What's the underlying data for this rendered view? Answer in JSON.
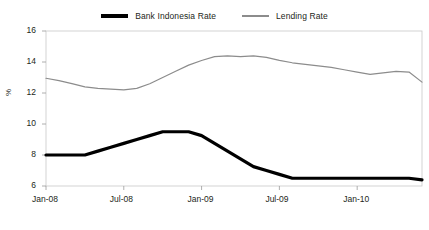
{
  "chart_data": {
    "type": "line",
    "title": "",
    "subtitle": "",
    "xlabel": "",
    "ylabel": "%",
    "ylim": [
      6,
      16
    ],
    "yticks": [
      6,
      8,
      10,
      12,
      14,
      16
    ],
    "xticks": [
      "Jan-08",
      "Jul-08",
      "Jan-09",
      "Jul-09",
      "Jan-10"
    ],
    "xtick_indices": [
      0,
      6,
      12,
      18,
      24
    ],
    "grid": false,
    "legend_position": "top-center",
    "x": [
      "Jan-08",
      "Feb-08",
      "Mar-08",
      "Apr-08",
      "May-08",
      "Jun-08",
      "Jul-08",
      "Aug-08",
      "Sep-08",
      "Oct-08",
      "Nov-08",
      "Dec-08",
      "Jan-09",
      "Feb-09",
      "Mar-09",
      "Apr-09",
      "May-09",
      "Jun-09",
      "Jul-09",
      "Aug-09",
      "Sep-09",
      "Oct-09",
      "Nov-09",
      "Dec-09",
      "Jan-10",
      "Feb-10",
      "Mar-10",
      "Apr-10",
      "May-10",
      "Jun-10"
    ],
    "series": [
      {
        "name": "Bank Indonesia Rate",
        "color": "#000000",
        "width": 3.2,
        "values": [
          8.0,
          8.0,
          8.0,
          8.0,
          8.25,
          8.5,
          8.75,
          9.0,
          9.25,
          9.5,
          9.5,
          9.5,
          9.25,
          8.75,
          8.25,
          7.75,
          7.25,
          7.0,
          6.75,
          6.5,
          6.5,
          6.5,
          6.5,
          6.5,
          6.5,
          6.5,
          6.5,
          6.5,
          6.5,
          6.4
        ]
      },
      {
        "name": "Lending Rate",
        "color": "#8c8c8c",
        "width": 1.2,
        "values": [
          12.95,
          12.8,
          12.6,
          12.4,
          12.3,
          12.25,
          12.2,
          12.3,
          12.6,
          13.0,
          13.4,
          13.8,
          14.1,
          14.35,
          14.4,
          14.35,
          14.4,
          14.3,
          14.1,
          13.95,
          13.85,
          13.75,
          13.65,
          13.5,
          13.35,
          13.2,
          13.3,
          13.4,
          13.35,
          12.7
        ]
      }
    ]
  }
}
